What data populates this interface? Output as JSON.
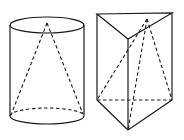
{
  "figures": [
    {
      "name": "cylinder-with-inscribed-cone",
      "solid": "cylinder",
      "inscribed": "cone",
      "cylinder": {
        "top_center": [
          47,
          25
        ],
        "bottom_center": [
          47,
          116
        ],
        "rx": 37,
        "ry": 8
      },
      "cone_apex": [
        47,
        23
      ],
      "cone_base_left": [
        11,
        116
      ],
      "cone_base_right": [
        84,
        116
      ]
    },
    {
      "name": "triangular-prism-with-inscribed-pyramid",
      "solid": "triangular prism",
      "inscribed": "triangular pyramid",
      "prism_top": [
        [
          97,
          14
        ],
        [
          172,
          13
        ],
        [
          128,
          39
        ]
      ],
      "prism_bottom": [
        [
          97,
          100
        ],
        [
          172,
          100
        ],
        [
          128,
          130
        ]
      ],
      "pyramid_apex": [
        147,
        19
      ]
    }
  ],
  "style": {
    "line_color": "#1a1a1a",
    "background": "#ffffff"
  }
}
